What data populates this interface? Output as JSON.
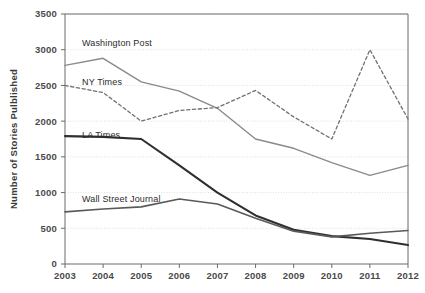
{
  "chart_data": {
    "type": "line",
    "title": "",
    "xlabel": "",
    "ylabel": "Number of Stories Pulblished",
    "categories": [
      "2003",
      "2004",
      "2005",
      "2006",
      "2007",
      "2008",
      "2009",
      "2010",
      "2011",
      "2012"
    ],
    "x": [
      2003,
      2004,
      2005,
      2006,
      2007,
      2008,
      2009,
      2010,
      2011,
      2012
    ],
    "ylim": [
      0,
      3500
    ],
    "xlim": [
      2003,
      2012
    ],
    "yticks": [
      0,
      500,
      1000,
      1500,
      2000,
      2500,
      3000,
      3500
    ],
    "ytick_labels": [
      "0",
      "500",
      "1000",
      "1500",
      "2000",
      "2500",
      "3000",
      "3500"
    ],
    "grid": true,
    "legend_position": "inline-annotations",
    "series": [
      {
        "name": "Washington Post",
        "style": "solid",
        "color": "#8a8a8a",
        "width": 1.4,
        "values": [
          2780,
          2880,
          2550,
          2420,
          2180,
          1750,
          1620,
          1420,
          1240,
          1380
        ]
      },
      {
        "name": "NY Times",
        "style": "dashed",
        "color": "#707070",
        "width": 1.3,
        "values": [
          2500,
          2400,
          2000,
          2150,
          2190,
          2430,
          2060,
          1750,
          3000,
          2030
        ]
      },
      {
        "name": "LA Times",
        "style": "solid",
        "color": "#2f2f2f",
        "width": 2.1,
        "values": [
          1790,
          1780,
          1750,
          1380,
          1000,
          680,
          480,
          390,
          350,
          265
        ]
      },
      {
        "name": "Wall Street Journal",
        "style": "solid",
        "color": "#5a5a5a",
        "width": 1.6,
        "values": [
          730,
          770,
          800,
          910,
          840,
          640,
          460,
          380,
          430,
          470
        ]
      }
    ],
    "annotations": [
      {
        "text": "Washington Post",
        "series": "Washington Post",
        "x_px": 82,
        "y_px": 46
      },
      {
        "text": "NY Times",
        "series": "NY Times",
        "x_px": 82,
        "y_px": 85
      },
      {
        "text": "LA Times",
        "series": "LA Times",
        "x_px": 82,
        "y_px": 138
      },
      {
        "text": "Wall Street Journal",
        "series": "Wall Street Journal",
        "x_px": 82,
        "y_px": 202
      }
    ]
  },
  "axes": {
    "ylabel": "Number of Stories Pulblished",
    "ytick_labels": [
      "3500",
      "3000",
      "2500",
      "2000",
      "1500",
      "1000",
      "500",
      "0"
    ],
    "xtick_labels": [
      "2003",
      "2004",
      "2005",
      "2006",
      "2007",
      "2008",
      "2009",
      "2010",
      "2011",
      "2012"
    ]
  },
  "colors": {
    "background": "#ffffff",
    "grid": "#d8d8d8",
    "axis": "#6b6b6b",
    "text": "#4a4a4a",
    "washington_post": "#8a8a8a",
    "ny_times": "#707070",
    "la_times": "#2f2f2f",
    "wall_street_journal": "#5a5a5a"
  }
}
